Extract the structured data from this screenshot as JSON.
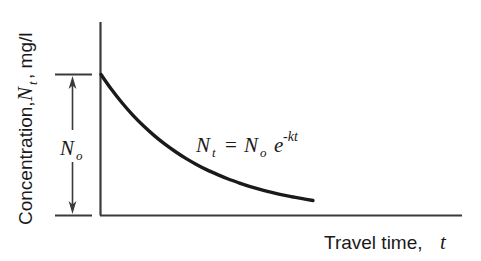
{
  "chart_data": {
    "type": "line",
    "title": "",
    "xlabel": "Travel time, t",
    "ylabel": "Concentration, N_t, mg/l",
    "xlabel_main": "Travel time,",
    "xlabel_var": "t",
    "ylabel_main": "Concentration,",
    "ylabel_var": "N",
    "ylabel_var_sub": "t",
    "ylabel_units": ", mg/l",
    "grid": false,
    "legend": null,
    "axes_ticks_labeled": false,
    "xlim": [
      0,
      1
    ],
    "ylim": [
      0,
      1
    ],
    "annotations": [
      {
        "name": "decay-equation",
        "text": "N_t = N_o e^-kt",
        "parts": {
          "lhs_var": "N",
          "lhs_sub": "t",
          "equals": "=",
          "rhs_var": "N",
          "rhs_sub": "o",
          "exp_base": "e",
          "exp_sup": "-kt"
        },
        "x": 0.47,
        "y": 0.46
      },
      {
        "name": "initial-concentration-bracket",
        "text": "N_o",
        "parts": {
          "var": "N",
          "sub": "o"
        },
        "description": "double-headed arrow spanning initial concentration N_o"
      }
    ],
    "series": [
      {
        "name": "exponential-decay",
        "equation": "N_t = N_o e^-kt",
        "x": [
          0.0,
          0.05,
          0.1,
          0.15,
          0.2,
          0.25,
          0.3,
          0.35,
          0.4,
          0.45,
          0.5,
          0.55,
          0.6,
          0.65,
          0.7,
          0.75,
          0.8,
          0.85,
          0.9,
          0.95,
          1.0
        ],
        "y": [
          1.0,
          0.893,
          0.797,
          0.711,
          0.635,
          0.567,
          0.506,
          0.452,
          0.403,
          0.36,
          0.321,
          0.287,
          0.256,
          0.229,
          0.204,
          0.182,
          0.163,
          0.145,
          0.13,
          0.116,
          0.103
        ],
        "decay_constant_k": 2.27,
        "color": "#1a1a1a",
        "line_width": 3.4
      }
    ]
  },
  "colors": {
    "background": "#ffffff",
    "axis": "#3a3a3a",
    "curve": "#1a1a1a",
    "text": "#1a1a1a",
    "arrow": "#3a3a3a"
  }
}
